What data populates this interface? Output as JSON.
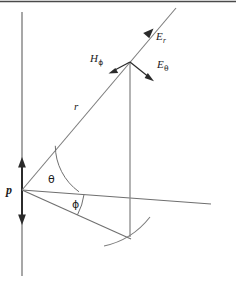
{
  "figure": {
    "name": "dipole-radiation-field-diagram",
    "background_color": "#ffffff",
    "line_color": "#8a8a8a",
    "dark_line_color": "#3a3a3a",
    "text_color": "#1a1a1a",
    "top_rule_color": "#4a4a4a"
  },
  "labels": {
    "dipole_moment": "p",
    "radius": "r",
    "polar_angle": "θ",
    "azimuth_angle": "ϕ",
    "e_radial_symbol": "E",
    "e_radial_subscript": "r",
    "e_theta_symbol": "E",
    "e_theta_subscript": "θ",
    "h_phi_symbol": "H",
    "h_phi_subscript": "ϕ"
  },
  "geometry": {
    "origin": {
      "x": 22,
      "y": 190
    },
    "field_point": {
      "x": 130,
      "y": 62
    },
    "vertical_axis": {
      "x": 22,
      "y_top": 12,
      "y_bottom": 276
    },
    "dipole_arrow": {
      "x": 22,
      "y_top": 160,
      "y_bottom": 222
    },
    "radial_ray_end": {
      "x": 176,
      "y": 8
    },
    "horizontal_ray_end": {
      "x": 211,
      "y": 204
    },
    "phi_ray_end": {
      "x": 131,
      "y": 239
    },
    "drop_line": {
      "x": 130,
      "y_top": 62,
      "y_bottom": 237
    },
    "theta_arc_radius": 57,
    "phi_arc_radius": 62
  },
  "vectors": [
    {
      "name": "E_r",
      "direction": "radial outward",
      "angle_deg": 50
    },
    {
      "name": "E_theta",
      "direction": "perpendicular to radius, increasing theta",
      "angle_deg": -40
    },
    {
      "name": "H_phi",
      "direction": "azimuthal, into-plane side",
      "angle_deg": 200
    }
  ]
}
